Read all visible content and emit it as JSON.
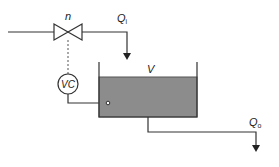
{
  "diagram": {
    "type": "process-control-schematic",
    "labels": {
      "valve": "n",
      "inflow_main": "Q",
      "inflow_sub": "i",
      "volume": "V",
      "controller": "VC",
      "outflow_main": "Q",
      "outflow_sub": "o"
    },
    "colors": {
      "line": "#333333",
      "fluid": "#8c8c8c",
      "fluid_border": "#555555",
      "background": "#ffffff"
    }
  }
}
